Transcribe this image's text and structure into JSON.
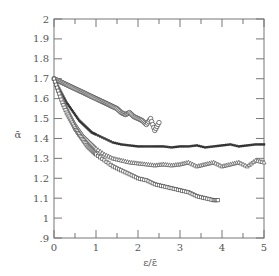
{
  "chart_data": {
    "type": "scatter",
    "title": "",
    "xlabel": "ε/ε̄",
    "ylabel": "ᾱ",
    "xlim": [
      0,
      5
    ],
    "ylim": [
      0.9,
      2.0
    ],
    "xticks": [
      "0",
      "1",
      "2",
      "3",
      "4",
      "5"
    ],
    "yticks": [
      ".9",
      "1",
      "1.1",
      "1.2",
      "1.3",
      "1.4",
      "1.5",
      "1.6",
      "1.7",
      "1.8",
      "1.9",
      "2"
    ],
    "grid": false,
    "legend": null,
    "series": [
      {
        "name": "circles",
        "marker": "open-circle",
        "x": [
          0,
          0.1,
          0.2,
          0.3,
          0.4,
          0.5,
          0.6,
          0.7,
          0.8,
          0.9,
          1.0,
          1.1,
          1.2,
          1.3,
          1.4,
          1.5,
          1.6,
          1.7,
          1.8,
          1.9,
          2.0,
          2.1,
          2.2,
          2.3,
          2.4,
          2.5
        ],
        "y": [
          1.7,
          1.69,
          1.68,
          1.67,
          1.66,
          1.65,
          1.64,
          1.63,
          1.62,
          1.61,
          1.6,
          1.59,
          1.58,
          1.57,
          1.56,
          1.55,
          1.53,
          1.52,
          1.53,
          1.51,
          1.5,
          1.49,
          1.47,
          1.5,
          1.44,
          1.48
        ]
      },
      {
        "name": "filled-markers",
        "marker": "filled-small",
        "x": [
          0,
          0.1,
          0.2,
          0.3,
          0.4,
          0.5,
          0.6,
          0.7,
          0.8,
          0.9,
          1.0,
          1.2,
          1.4,
          1.6,
          1.8,
          2.0,
          2.2,
          2.4,
          2.6,
          2.8,
          3.0,
          3.2,
          3.4,
          3.6,
          3.8,
          4.0,
          4.2,
          4.4,
          4.6,
          4.8,
          5.0
        ],
        "y": [
          1.7,
          1.66,
          1.62,
          1.58,
          1.55,
          1.52,
          1.49,
          1.47,
          1.45,
          1.43,
          1.42,
          1.4,
          1.38,
          1.37,
          1.365,
          1.36,
          1.36,
          1.36,
          1.36,
          1.355,
          1.36,
          1.36,
          1.365,
          1.355,
          1.36,
          1.365,
          1.37,
          1.36,
          1.365,
          1.37,
          1.37
        ]
      },
      {
        "name": "triangles",
        "marker": "open-triangle",
        "x": [
          0,
          0.1,
          0.2,
          0.3,
          0.4,
          0.5,
          0.6,
          0.7,
          0.8,
          0.9,
          1.0,
          1.2,
          1.4,
          1.6,
          1.8,
          2.0,
          2.2,
          2.4,
          2.6,
          2.8,
          3.0,
          3.2,
          3.4,
          3.6,
          3.8,
          4.0,
          4.2,
          4.4,
          4.6,
          4.8,
          5.0
        ],
        "y": [
          1.7,
          1.65,
          1.6,
          1.55,
          1.51,
          1.47,
          1.44,
          1.41,
          1.39,
          1.37,
          1.35,
          1.32,
          1.3,
          1.29,
          1.28,
          1.275,
          1.27,
          1.265,
          1.27,
          1.265,
          1.27,
          1.28,
          1.26,
          1.27,
          1.28,
          1.26,
          1.27,
          1.28,
          1.26,
          1.29,
          1.28
        ]
      },
      {
        "name": "squares",
        "marker": "open-square",
        "x": [
          0,
          0.1,
          0.2,
          0.3,
          0.4,
          0.5,
          0.6,
          0.7,
          0.8,
          0.9,
          1.0,
          1.2,
          1.4,
          1.6,
          1.8,
          2.0,
          2.2,
          2.4,
          2.6,
          2.8,
          3.0,
          3.2,
          3.4,
          3.6,
          3.8,
          3.9
        ],
        "y": [
          1.7,
          1.64,
          1.58,
          1.53,
          1.49,
          1.45,
          1.42,
          1.39,
          1.36,
          1.34,
          1.32,
          1.29,
          1.26,
          1.24,
          1.22,
          1.2,
          1.19,
          1.17,
          1.16,
          1.15,
          1.14,
          1.13,
          1.11,
          1.1,
          1.09,
          1.09
        ]
      }
    ]
  },
  "axes": {
    "xlabel": "ε/ε̄",
    "ylabel": "ᾱ",
    "xtick_labels": [
      "0",
      "1",
      "2",
      "3",
      "4",
      "5"
    ],
    "ytick_labels": [
      ".9",
      "1",
      "1.1",
      "1.2",
      "1.3",
      "1.4",
      "1.5",
      "1.6",
      "1.7",
      "1.8",
      "1.9",
      "2"
    ]
  }
}
